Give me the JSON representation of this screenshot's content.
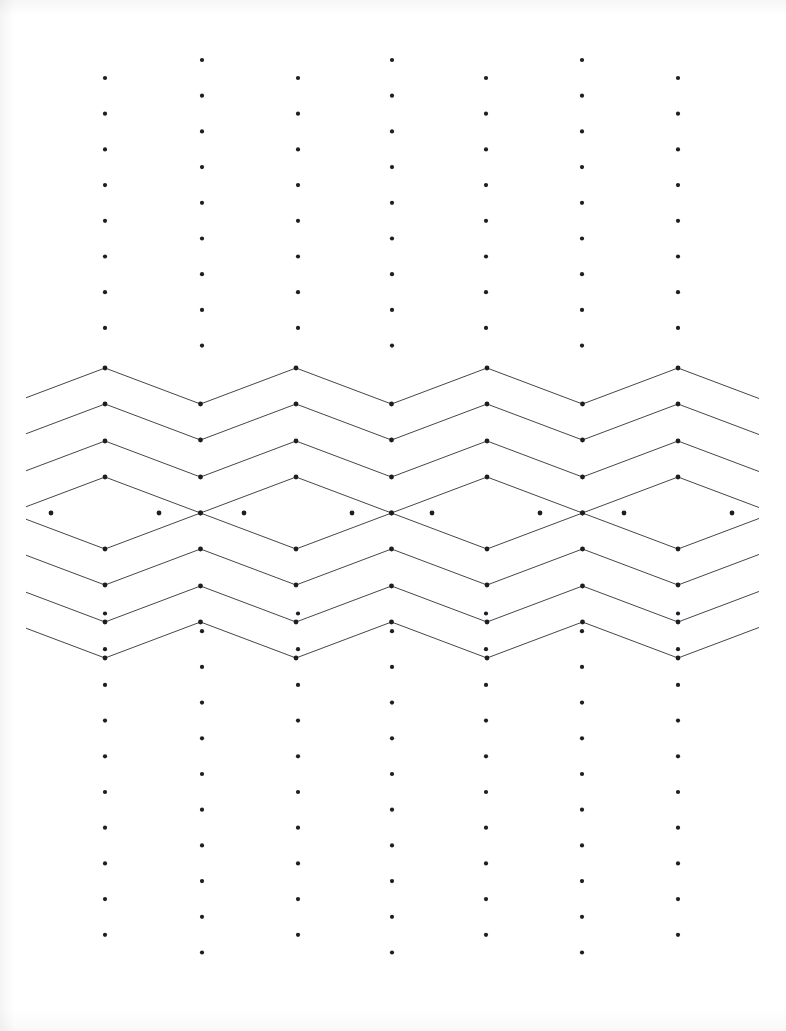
{
  "sheet": {
    "title": "Dot Grid Pattern Sheet",
    "width": 786,
    "height": 1031,
    "paper_color": "#ffffff",
    "ink_color": "#303038",
    "dot_color": "#1d1d23"
  },
  "grid": {
    "name": "offset-dot-lattice",
    "columns": 7,
    "column_x": [
      105,
      202,
      298,
      392,
      486,
      582,
      678
    ],
    "column_spacing": 95.5,
    "row_spacing": 35.7,
    "odd_column_first_dot_y": 78,
    "even_column_first_dot_y": 60,
    "dot_radius": 2.1,
    "top_band_rows": 8,
    "bottom_band_rows": 10,
    "top_band_start_y": 60,
    "bottom_band_end_y": 950
  },
  "pattern": {
    "name": "nested-chevron-diamond-band",
    "description": "Four nested zigzag chevrons forming concentric diamonds centred on the odd dot columns",
    "band_top_y": 368,
    "band_bottom_y": 585,
    "center_y": 513,
    "amplitude": 36,
    "half_period": 95.5,
    "ring_count": 4,
    "ring_offsets": [
      145,
      109,
      72,
      36
    ],
    "line_width": 0.9,
    "vertex_dot_radius": 2.4,
    "left_clip_x": 26,
    "right_clip_x": 759,
    "diamond_centers_x": [
      105,
      298,
      486,
      678
    ],
    "inner_diamond": {
      "top_y": 477,
      "bottom_y": 549,
      "left_x_offset": -54,
      "right_x_offset": 54
    }
  },
  "chart_data": {
    "type": "scatter",
    "subtitle": "Nested chevron / concentric diamond band on an offset dot lattice",
    "xlabel": "",
    "ylabel": "",
    "xlim": [
      0,
      786
    ],
    "ylim": [
      0,
      1031
    ],
    "grid": false,
    "legend": "none",
    "series": [
      {
        "name": "dot-lattice-odd-columns",
        "marker": "dot",
        "x": [
          105,
          298,
          486,
          678
        ],
        "description": "Columns beginning at y=78, 35.7 px pitch; dots suppressed inside the pattern band",
        "y_top_band": [
          78,
          113,
          149,
          185,
          221,
          256,
          292,
          328
        ],
        "y_bottom_band": [
          620,
          656,
          692,
          727,
          763,
          799,
          835,
          870,
          906,
          942
        ]
      },
      {
        "name": "dot-lattice-even-columns",
        "marker": "dot",
        "x": [
          202,
          392,
          582
        ],
        "description": "Half-step offset columns beginning at y=60, 35.7 px pitch",
        "y_top_band": [
          60,
          96,
          131,
          167,
          203,
          239,
          274,
          310,
          346
        ],
        "y_bottom_band": [
          602,
          638,
          674,
          709,
          745,
          781,
          817,
          852,
          888,
          924,
          960
        ]
      },
      {
        "name": "chevron-ring-1",
        "marker": "line",
        "description": "Outermost zigzag pair, peak y=368 above centre and y=658 mirrored trough",
        "peak_y": 368,
        "trough_y": 441
      },
      {
        "name": "chevron-ring-2",
        "marker": "line",
        "description": "Second zigzag pair",
        "peak_y": 404,
        "trough_y": 441
      },
      {
        "name": "chevron-ring-3",
        "marker": "line",
        "description": "Third zigzag pair",
        "peak_y": 441,
        "trough_y": 477
      },
      {
        "name": "chevron-ring-4",
        "marker": "line",
        "description": "Innermost diamonds touching at the even columns",
        "peak_y": 477,
        "trough_y": 513
      }
    ]
  }
}
